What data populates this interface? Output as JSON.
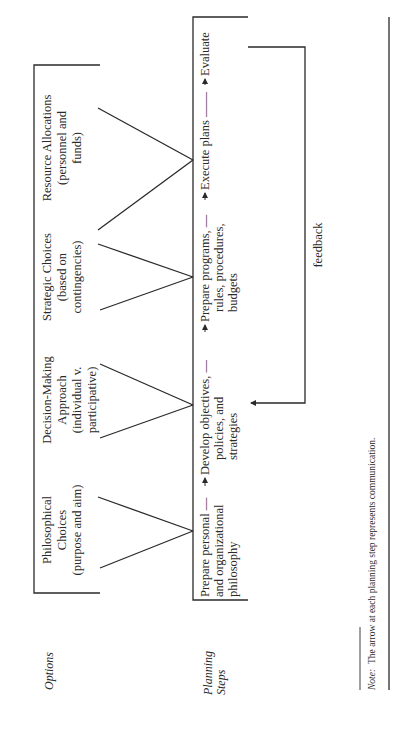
{
  "diagram": {
    "row_labels": {
      "options": "Options",
      "planning_line1": "Planning",
      "planning_line2": "Steps"
    },
    "options": [
      {
        "lines": [
          "Philosophical",
          "Choices",
          "(purpose and aim)"
        ]
      },
      {
        "lines": [
          "Decision-Making",
          "Approach",
          "(individual v.",
          "participative)"
        ]
      },
      {
        "lines": [
          "Strategic Choices",
          "(based on",
          "contingencies)"
        ]
      },
      {
        "lines": [
          "Resource Allocations",
          "(personnel and",
          "funds)"
        ]
      }
    ],
    "planning_steps": [
      {
        "lines": [
          "Prepare personal —",
          "and organizational",
          "philosophy"
        ]
      },
      {
        "lines": [
          "Develop objectives, —",
          "policies, and",
          "strategies"
        ]
      },
      {
        "lines": [
          "Prepare programs, —",
          "rules, procedures,",
          "budgets"
        ]
      },
      {
        "lines": [
          "Execute plans ——"
        ]
      },
      {
        "lines": [
          "Evaluate"
        ]
      }
    ],
    "feedback_label": "feedback",
    "note_label": "Note:",
    "note_text": "The arrow at each planning step represents communication.",
    "colors": {
      "ink": "#2a2a2a",
      "background": "#ffffff"
    }
  }
}
